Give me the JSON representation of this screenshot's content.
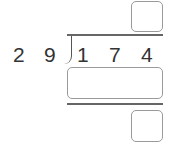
{
  "problem": {
    "divisor_digits": [
      "2",
      "9"
    ],
    "dividend_digits": [
      "1",
      "7",
      "4"
    ],
    "answer_boxes": {
      "quotient": "",
      "product": "",
      "remainder": ""
    }
  }
}
